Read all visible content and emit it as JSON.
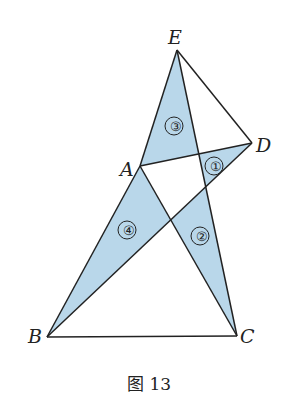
{
  "figure": {
    "points": {
      "E": "E",
      "D": "D",
      "A": "A",
      "B": "B",
      "C": "C"
    },
    "regions": [
      "①",
      "②",
      "③",
      "④"
    ],
    "caption": "图 13",
    "fill_color": "#b9d7ea",
    "line_color": "#222222"
  }
}
